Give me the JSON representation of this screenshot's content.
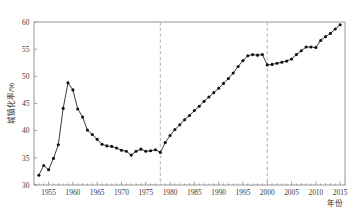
{
  "chart_data": {
    "type": "line",
    "title": "",
    "subtitle": "",
    "xlabel": "年份",
    "ylabel": "城镇化率/%",
    "xlim": [
      1952,
      2016
    ],
    "ylim": [
      30,
      60
    ],
    "grid": false,
    "legend": null,
    "marker": "filled-circle",
    "line_color": "#111111",
    "reference_lines": [
      {
        "x": 1978,
        "style": "dashed",
        "color": "#b6b6b6"
      },
      {
        "x": 2000,
        "style": "dashed",
        "color": "#b6b6b6"
      }
    ],
    "xticks": [
      1955,
      1960,
      1965,
      1970,
      1975,
      1980,
      1985,
      1990,
      1995,
      2000,
      2005,
      2010,
      2015
    ],
    "xtick_labels": [
      "1955",
      "1960",
      "1965",
      "1970",
      "1975",
      "1980",
      "1985",
      "1990",
      "1995",
      "2000",
      "2005",
      "2010",
      "2015"
    ],
    "yticks": [
      30,
      35,
      40,
      45,
      50,
      55,
      60
    ],
    "ytick_labels": [
      "30",
      "35",
      "40",
      "45",
      "50",
      "55",
      "60"
    ],
    "series": [
      {
        "name": "城镇化率",
        "x": [
          1953,
          1954,
          1955,
          1956,
          1957,
          1958,
          1959,
          1960,
          1961,
          1962,
          1963,
          1964,
          1965,
          1966,
          1967,
          1968,
          1969,
          1970,
          1971,
          1972,
          1973,
          1974,
          1975,
          1976,
          1977,
          1978,
          1979,
          1980,
          1981,
          1982,
          1983,
          1984,
          1985,
          1986,
          1987,
          1988,
          1989,
          1990,
          1991,
          1992,
          1993,
          1994,
          1995,
          1996,
          1997,
          1998,
          1999,
          2000,
          2001,
          2002,
          2003,
          2004,
          2005,
          2006,
          2007,
          2008,
          2009,
          2010,
          2011,
          2012,
          2013,
          2014,
          2015
        ],
        "values": [
          31.8,
          33.6,
          32.8,
          34.9,
          37.4,
          44.1,
          48.8,
          47.5,
          44.0,
          42.5,
          40.1,
          39.3,
          38.4,
          37.5,
          37.2,
          37.1,
          36.8,
          36.4,
          36.2,
          35.5,
          36.2,
          36.6,
          36.2,
          36.3,
          36.5,
          36.0,
          37.8,
          39.1,
          40.2,
          41.1,
          42.0,
          42.8,
          43.7,
          44.5,
          45.4,
          46.2,
          47.0,
          47.8,
          48.7,
          49.6,
          50.6,
          51.8,
          52.9,
          53.8,
          54.0,
          53.9,
          54.0,
          52.1,
          52.2,
          52.4,
          52.6,
          52.8,
          53.2,
          54.0,
          54.7,
          55.4,
          55.4,
          55.3,
          56.6,
          57.3,
          57.9,
          58.7,
          59.5
        ]
      }
    ]
  },
  "axis": {
    "y_label": "城镇化率/%",
    "x_label": "年份"
  }
}
